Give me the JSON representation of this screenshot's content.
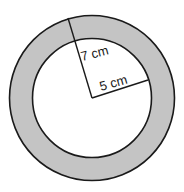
{
  "diagram": {
    "type": "annulus",
    "colors": {
      "ring_fill": "#c4c4c4",
      "inner_fill": "#ffffff",
      "stroke": "#1a1a1a"
    },
    "outer_radius_label": "7 cm",
    "inner_radius_label": "5 cm"
  }
}
